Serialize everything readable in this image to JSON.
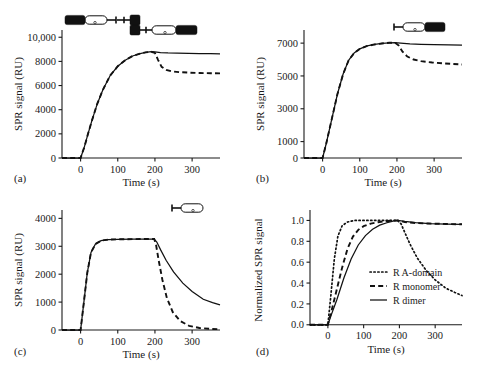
{
  "figure": {
    "panels": [
      "(a)",
      "(b)",
      "(c)",
      "(d)"
    ],
    "xlabel": "Time (s)",
    "ylabel_raw": "SPR signal (RU)",
    "ylabel_norm": "Normalized SPR signal"
  },
  "chart_data": [
    {
      "type": "line",
      "panel": "(a)",
      "title": "",
      "xlabel": "Time (s)",
      "ylabel": "SPR signal (RU)",
      "xlim": [
        -50,
        375
      ],
      "ylim": [
        0,
        10600
      ],
      "xticks": [
        0,
        100,
        200,
        300
      ],
      "xtick_labels": [
        "0",
        "100",
        "200",
        "300"
      ],
      "yticks": [
        0,
        2000,
        4000,
        6000,
        8000,
        10000
      ],
      "ytick_labels": [
        "0",
        "2000",
        "4000",
        "6000",
        "8000",
        "10,000"
      ],
      "grid": false,
      "inset": "dimer",
      "series": [
        {
          "name": "solid",
          "style": "solid",
          "x": [
            -50,
            -10,
            0,
            10,
            20,
            30,
            45,
            60,
            80,
            100,
            120,
            140,
            160,
            175,
            190,
            200,
            215,
            235,
            260,
            290,
            320,
            350,
            375
          ],
          "y": [
            0,
            0,
            0,
            900,
            2000,
            3050,
            4500,
            5650,
            6850,
            7600,
            8100,
            8450,
            8650,
            8750,
            8800,
            8780,
            8730,
            8700,
            8680,
            8660,
            8650,
            8640,
            8630
          ]
        },
        {
          "name": "dashed",
          "style": "dashed",
          "x": [
            -50,
            -10,
            0,
            10,
            20,
            30,
            45,
            60,
            80,
            100,
            120,
            140,
            160,
            175,
            190,
            200,
            208,
            218,
            230,
            245,
            265,
            290,
            320,
            350,
            375
          ],
          "y": [
            0,
            0,
            0,
            900,
            2000,
            3050,
            4500,
            5650,
            6850,
            7600,
            8100,
            8450,
            8650,
            8750,
            8800,
            8700,
            8150,
            7550,
            7300,
            7180,
            7110,
            7070,
            7040,
            7020,
            7010
          ]
        }
      ]
    },
    {
      "type": "line",
      "panel": "(b)",
      "title": "",
      "xlabel": "Time (s)",
      "ylabel": "SPR signal (RU)",
      "xlim": [
        -50,
        375
      ],
      "ylim": [
        0,
        7800
      ],
      "xticks": [
        0,
        100,
        200,
        300
      ],
      "xtick_labels": [
        "0",
        "100",
        "200",
        "300"
      ],
      "yticks": [
        0,
        1000,
        3000,
        5000,
        7000
      ],
      "ytick_labels": [
        "0",
        "1000",
        "3000",
        "5000",
        "7000"
      ],
      "grid": false,
      "inset": "monomer",
      "series": [
        {
          "name": "solid",
          "style": "solid",
          "x": [
            -50,
            -10,
            0,
            10,
            25,
            40,
            55,
            70,
            85,
            100,
            120,
            140,
            160,
            180,
            195,
            210,
            235,
            265,
            300,
            340,
            375
          ],
          "y": [
            0,
            0,
            0,
            900,
            2400,
            3900,
            5100,
            5950,
            6400,
            6650,
            6830,
            6920,
            6980,
            7020,
            7030,
            7000,
            6960,
            6930,
            6910,
            6890,
            6880
          ]
        },
        {
          "name": "dashed",
          "style": "dashed",
          "x": [
            -50,
            -10,
            0,
            10,
            25,
            40,
            55,
            70,
            85,
            100,
            120,
            140,
            160,
            180,
            195,
            205,
            215,
            228,
            245,
            265,
            295,
            330,
            375
          ],
          "y": [
            0,
            0,
            0,
            900,
            2400,
            3900,
            5100,
            5950,
            6400,
            6650,
            6830,
            6920,
            6980,
            7020,
            7030,
            6850,
            6480,
            6180,
            6000,
            5900,
            5820,
            5760,
            5700
          ]
        }
      ]
    },
    {
      "type": "line",
      "panel": "(c)",
      "title": "",
      "xlabel": "Time (s)",
      "ylabel": "SPR signal (RU)",
      "xlim": [
        -50,
        375
      ],
      "ylim": [
        0,
        4300
      ],
      "xticks": [
        0,
        100,
        200,
        300
      ],
      "xtick_labels": [
        "0",
        "100",
        "200",
        "300"
      ],
      "yticks": [
        0,
        1000,
        2000,
        3000,
        4000
      ],
      "ytick_labels": [
        "0",
        "1000",
        "2000",
        "3000",
        "4000"
      ],
      "grid": false,
      "inset": "adomain",
      "series": [
        {
          "name": "solid",
          "style": "solid",
          "x": [
            -50,
            -10,
            0,
            8,
            18,
            28,
            40,
            55,
            75,
            100,
            140,
            175,
            198,
            205,
            215,
            230,
            250,
            275,
            300,
            330,
            355,
            375
          ],
          "y": [
            0,
            0,
            0,
            900,
            2050,
            2780,
            3080,
            3200,
            3240,
            3250,
            3255,
            3260,
            3260,
            3150,
            2880,
            2500,
            2080,
            1680,
            1380,
            1100,
            980,
            900
          ]
        },
        {
          "name": "dashed",
          "style": "dashed",
          "x": [
            -50,
            -10,
            0,
            8,
            18,
            28,
            40,
            55,
            75,
            100,
            140,
            175,
            198,
            203,
            210,
            220,
            232,
            248,
            268,
            292,
            320,
            350,
            375
          ],
          "y": [
            0,
            0,
            0,
            900,
            2050,
            2780,
            3080,
            3200,
            3240,
            3250,
            3255,
            3260,
            3260,
            3050,
            2500,
            1800,
            1150,
            640,
            320,
            150,
            70,
            40,
            30
          ]
        }
      ]
    },
    {
      "type": "line",
      "panel": "(d)",
      "title": "",
      "xlabel": "Time (s)",
      "ylabel": "Normalized SPR signal",
      "xlim": [
        -50,
        375
      ],
      "ylim": [
        -0.05,
        1.1
      ],
      "xticks": [
        0,
        100,
        200,
        300
      ],
      "xtick_labels": [
        "0",
        "100",
        "200",
        "300"
      ],
      "yticks": [
        0.0,
        0.2,
        0.4,
        0.6,
        0.8,
        1.0
      ],
      "ytick_labels": [
        "0.0",
        "0.2",
        "0.4",
        "0.6",
        "0.8",
        "1.0"
      ],
      "grid": false,
      "legend_position": "center-right",
      "series": [
        {
          "name": "R A-domain",
          "style": "dotted",
          "x": [
            -50,
            -10,
            0,
            8,
            18,
            28,
            40,
            55,
            75,
            100,
            140,
            175,
            195,
            205,
            215,
            230,
            250,
            275,
            300,
            330,
            355,
            375
          ],
          "y": [
            0,
            0,
            0,
            0.27,
            0.63,
            0.85,
            0.95,
            0.985,
            1.0,
            1.0,
            1.0,
            1.0,
            1.0,
            0.965,
            0.885,
            0.77,
            0.64,
            0.52,
            0.43,
            0.35,
            0.31,
            0.28
          ]
        },
        {
          "name": "R monomer",
          "style": "dashed",
          "x": [
            -50,
            -10,
            0,
            10,
            25,
            40,
            55,
            70,
            85,
            100,
            120,
            140,
            160,
            180,
            195,
            215,
            245,
            285,
            330,
            375
          ],
          "y": [
            0,
            0,
            0,
            0.13,
            0.34,
            0.55,
            0.73,
            0.845,
            0.91,
            0.945,
            0.97,
            0.983,
            0.992,
            0.998,
            1.0,
            0.985,
            0.975,
            0.97,
            0.966,
            0.963
          ]
        },
        {
          "name": "R dimer",
          "style": "solid",
          "x": [
            -50,
            -10,
            0,
            10,
            25,
            45,
            65,
            85,
            105,
            125,
            145,
            165,
            185,
            195,
            215,
            245,
            285,
            330,
            375
          ],
          "y": [
            0,
            0,
            0,
            0.1,
            0.24,
            0.45,
            0.63,
            0.765,
            0.855,
            0.915,
            0.955,
            0.978,
            0.995,
            1.0,
            0.99,
            0.978,
            0.97,
            0.965,
            0.962
          ]
        }
      ]
    }
  ]
}
